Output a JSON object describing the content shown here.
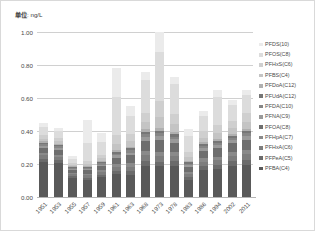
{
  "caption": {
    "unit_key": "单位",
    "unit_value": ": ng/L"
  },
  "chart_data": {
    "type": "bar",
    "title": "",
    "subtitle": "",
    "xlabel": "",
    "ylabel": "单位: ng/L",
    "stacked": true,
    "grid": true,
    "legend_position": "right",
    "ylim": [
      0.0,
      1.0
    ],
    "yticks": [
      "0.00",
      "0.20",
      "0.40",
      "0.60",
      "0.80",
      "1.00"
    ],
    "ytick_values": [
      0.0,
      0.2,
      0.4,
      0.6,
      0.8,
      1.0
    ],
    "categories": [
      "1951",
      "1953",
      "1955",
      "1957",
      "1959",
      "1961",
      "1963",
      "1968",
      "1973",
      "1978",
      "1983",
      "1986",
      "1994",
      "2002",
      "2011"
    ],
    "series": [
      {
        "name": "PFBA(C4)",
        "color": "#595959",
        "values": [
          0.21,
          0.205,
          0.115,
          0.105,
          0.12,
          0.14,
          0.135,
          0.19,
          0.185,
          0.19,
          0.105,
          0.165,
          0.17,
          0.19,
          0.195
        ]
      },
      {
        "name": "PFPeA(C5)",
        "color": "#6b6b6b",
        "values": [
          0.022,
          0.02,
          0.012,
          0.012,
          0.014,
          0.02,
          0.024,
          0.03,
          0.03,
          0.028,
          0.016,
          0.024,
          0.026,
          0.028,
          0.03
        ]
      },
      {
        "name": "PFHxA(C6)",
        "color": "#7d7d7d",
        "values": [
          0.02,
          0.018,
          0.012,
          0.014,
          0.016,
          0.022,
          0.026,
          0.034,
          0.034,
          0.03,
          0.018,
          0.026,
          0.028,
          0.03,
          0.034
        ]
      },
      {
        "name": "PFHpA(C7)",
        "color": "#8a8a8a",
        "values": [
          0.014,
          0.013,
          0.009,
          0.01,
          0.012,
          0.016,
          0.02,
          0.026,
          0.026,
          0.024,
          0.013,
          0.02,
          0.021,
          0.023,
          0.026
        ]
      },
      {
        "name": "PFOA(C8)",
        "color": "#6e6e6e",
        "values": [
          0.034,
          0.032,
          0.016,
          0.022,
          0.026,
          0.04,
          0.048,
          0.062,
          0.068,
          0.058,
          0.03,
          0.046,
          0.05,
          0.054,
          0.062
        ]
      },
      {
        "name": "PFNA(C9)",
        "color": "#9a9a9a",
        "values": [
          0.012,
          0.011,
          0.007,
          0.008,
          0.009,
          0.014,
          0.017,
          0.022,
          0.024,
          0.02,
          0.011,
          0.016,
          0.018,
          0.019,
          0.022
        ]
      },
      {
        "name": "PFDA(C10)",
        "color": "#868686",
        "values": [
          0.01,
          0.009,
          0.006,
          0.007,
          0.008,
          0.012,
          0.014,
          0.018,
          0.02,
          0.017,
          0.009,
          0.013,
          0.015,
          0.016,
          0.018
        ]
      },
      {
        "name": "PFUdA(C12)",
        "color": "#767676",
        "values": [
          0.008,
          0.007,
          0.005,
          0.006,
          0.007,
          0.01,
          0.012,
          0.015,
          0.016,
          0.014,
          0.008,
          0.011,
          0.012,
          0.013,
          0.015
        ]
      },
      {
        "name": "PFDoA(C12)",
        "color": "#b0b0b0",
        "values": [
          0.007,
          0.006,
          0.004,
          0.005,
          0.006,
          0.009,
          0.01,
          0.013,
          0.014,
          0.012,
          0.007,
          0.01,
          0.011,
          0.011,
          0.013
        ]
      },
      {
        "name": "PFBS(C4)",
        "color": "#c4c4c4",
        "values": [
          0.018,
          0.016,
          0.01,
          0.014,
          0.018,
          0.04,
          0.032,
          0.044,
          0.07,
          0.048,
          0.024,
          0.03,
          0.038,
          0.034,
          0.04
        ]
      },
      {
        "name": "PFHxS(C6)",
        "color": "#cfcfcf",
        "values": [
          0.022,
          0.02,
          0.012,
          0.018,
          0.022,
          0.055,
          0.042,
          0.058,
          0.095,
          0.062,
          0.03,
          0.038,
          0.048,
          0.044,
          0.052
        ]
      },
      {
        "name": "PFOS(C8)",
        "color": "#dcdcdc",
        "values": [
          0.048,
          0.044,
          0.024,
          0.105,
          0.074,
          0.23,
          0.11,
          0.195,
          0.3,
          0.18,
          0.1,
          0.092,
          0.17,
          0.096,
          0.11
        ]
      },
      {
        "name": "PFDS(10)",
        "color": "#ebebeb",
        "values": [
          0.025,
          0.019,
          0.018,
          0.144,
          0.058,
          0.172,
          0.06,
          0.053,
          0.118,
          0.047,
          0.039,
          0.029,
          0.043,
          0.032,
          0.033
        ]
      }
    ]
  },
  "legend": {
    "items": [
      "PFDS(10)",
      "PFOS(C8)",
      "PFHxS(C6)",
      "PFBS(C4)",
      "PFDoA(C12)",
      "PFUdA(C12)",
      "PFDA(C10)",
      "PFNA(C9)",
      "PFOA(C8)",
      "PFHpA(C7)",
      "PFHxA(C6)",
      "PFPeA(C5)",
      "PFBA(C4)"
    ]
  }
}
